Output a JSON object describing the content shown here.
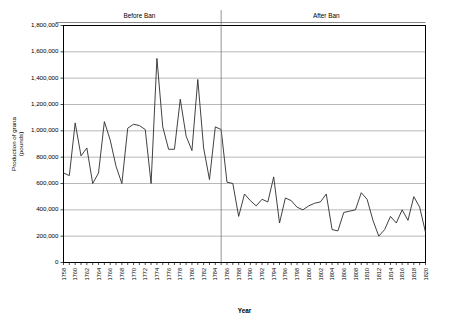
{
  "chart_data": {
    "type": "line",
    "title": "",
    "xlabel": "Year",
    "ylabel": "Production of grana (pounds)",
    "ylim": [
      0,
      1800000
    ],
    "xlim": [
      1758,
      1820
    ],
    "ytick_step": 200000,
    "xtick_step": 2,
    "grid": true,
    "legend": "none",
    "ytick_labels": [
      "0",
      "200,000",
      "400,000",
      "600,000",
      "800,000",
      "1,000,000",
      "1,200,000",
      "1,400,000",
      "1,600,000",
      "1,800,000"
    ],
    "xtick_labels": [
      "1758",
      "1760",
      "1762",
      "1764",
      "1766",
      "1768",
      "1770",
      "1772",
      "1774",
      "1776",
      "1778",
      "1780",
      "1782",
      "1784",
      "1786",
      "1788",
      "1790",
      "1792",
      "1794",
      "1796",
      "1798",
      "1800",
      "1802",
      "1804",
      "1806",
      "1808",
      "1810",
      "1812",
      "1814",
      "1816",
      "1818",
      "1820"
    ],
    "annotations": [
      {
        "name": "before-ban",
        "text": "Before Ban",
        "x": 1771
      },
      {
        "name": "after-ban",
        "text": "After Ban",
        "x": 1803
      }
    ],
    "divider_year": 1785,
    "x": [
      1758,
      1759,
      1760,
      1761,
      1762,
      1763,
      1764,
      1765,
      1766,
      1767,
      1768,
      1769,
      1770,
      1771,
      1772,
      1773,
      1774,
      1775,
      1776,
      1777,
      1778,
      1779,
      1780,
      1781,
      1782,
      1783,
      1784,
      1785,
      1786,
      1787,
      1788,
      1789,
      1790,
      1791,
      1792,
      1793,
      1794,
      1795,
      1796,
      1797,
      1798,
      1799,
      1800,
      1801,
      1802,
      1803,
      1804,
      1805,
      1806,
      1807,
      1808,
      1809,
      1810,
      1811,
      1812,
      1813,
      1814,
      1815,
      1816,
      1817,
      1818,
      1819,
      1820
    ],
    "values": [
      680000,
      660000,
      1060000,
      810000,
      870000,
      600000,
      680000,
      1070000,
      930000,
      730000,
      600000,
      1020000,
      1050000,
      1040000,
      1010000,
      600000,
      1550000,
      1030000,
      860000,
      860000,
      1240000,
      960000,
      850000,
      1390000,
      870000,
      630000,
      1030000,
      1010000,
      610000,
      600000,
      350000,
      520000,
      470000,
      430000,
      480000,
      460000,
      650000,
      300000,
      490000,
      470000,
      420000,
      400000,
      430000,
      450000,
      460000,
      520000,
      250000,
      240000,
      380000,
      390000,
      400000,
      530000,
      480000,
      320000,
      200000,
      250000,
      350000,
      300000,
      400000,
      320000,
      500000,
      420000,
      230000
    ]
  }
}
